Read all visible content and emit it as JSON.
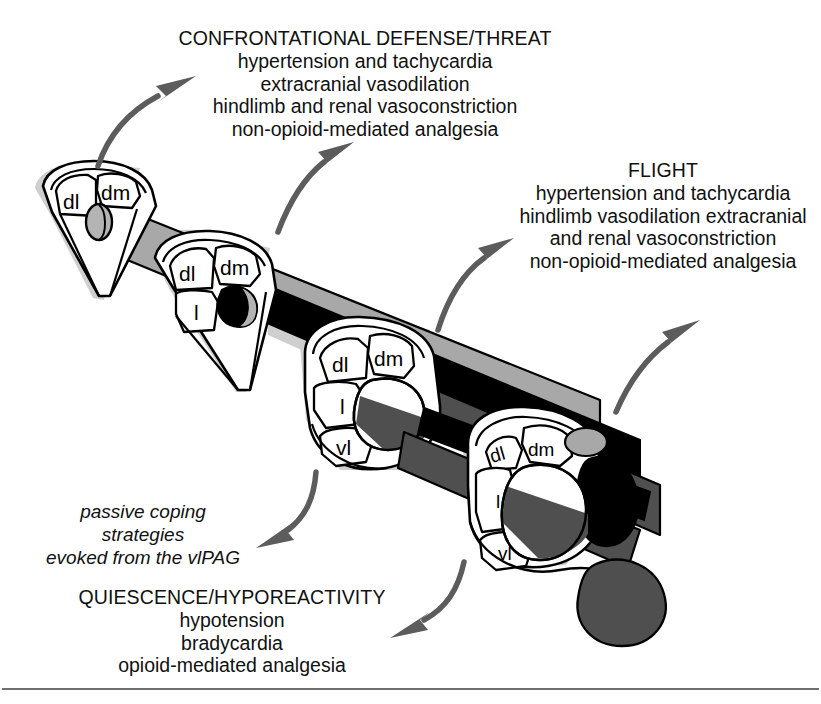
{
  "figure": {
    "background_color": "#ffffff",
    "outline_color": "#000000"
  },
  "colors": {
    "light_gray_column": "#a8a8a8",
    "mid_gray_column": "#5a5a5a",
    "dark_column": "#111111",
    "black_column": "#000000",
    "shadow": "#cfcfcf",
    "arrow": "#5c5c5c",
    "text": "#111111",
    "rule": "#6f6f6f"
  },
  "callouts": [
    {
      "id": "confrontational-defense",
      "title": "CONFRONTATIONAL DEFENSE/THREAT",
      "lines": [
        "hypertension and tachycardia",
        "extracranial vasodilation",
        "hindlimb and renal vasoconstriction",
        "non-opioid-mediated analgesia"
      ]
    },
    {
      "id": "flight",
      "title": "FLIGHT",
      "lines": [
        "hypertension and tachycardia",
        "hindlimb vasodilation extracranial",
        "and renal vasoconstriction",
        "non-opioid-mediated analgesia"
      ]
    },
    {
      "id": "quiescence-hyporeactivity",
      "title": "QUIESCENCE/HYPOREACTIVITY",
      "lines": [
        "hypotension",
        "bradycardia",
        "opioid-mediated analgesia"
      ]
    }
  ],
  "italic_note": {
    "id": "passive-coping-note",
    "lines": [
      "passive coping",
      "strategies",
      "evoked from the vlPAG"
    ]
  },
  "sections": [
    {
      "id": "section-1",
      "order": 1,
      "shape": "wedge",
      "subdivision_labels": [
        "dl",
        "dm"
      ]
    },
    {
      "id": "section-2",
      "order": 2,
      "shape": "wedge",
      "subdivision_labels": [
        "dl",
        "dm",
        "l"
      ]
    },
    {
      "id": "section-3",
      "order": 3,
      "shape": "rounded",
      "subdivision_labels": [
        "dl",
        "dm",
        "l",
        "vl"
      ]
    },
    {
      "id": "section-4",
      "order": 4,
      "shape": "rounded",
      "subdivision_labels": [
        "dl",
        "dm",
        "l",
        "vl"
      ]
    }
  ],
  "arrows": [
    {
      "id": "arrow-to-confrontational-upper",
      "direction": "up-right"
    },
    {
      "id": "arrow-to-confrontational-lower",
      "direction": "up-right"
    },
    {
      "id": "arrow-to-flight-left",
      "direction": "up-right"
    },
    {
      "id": "arrow-to-flight-right",
      "direction": "up-right"
    },
    {
      "id": "arrow-to-passive-coping",
      "direction": "down-left"
    },
    {
      "id": "arrow-to-quiescence",
      "direction": "down-left"
    }
  ]
}
